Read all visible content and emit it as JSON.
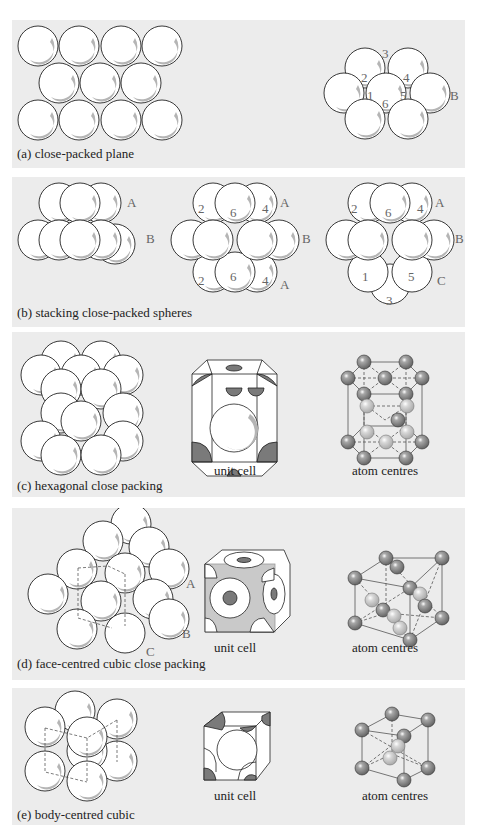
{
  "figure": {
    "panels": [
      {
        "id": "a",
        "caption": "(a) close-packed plane",
        "layer_labels": [
          "B"
        ],
        "site_numbers": [
          "1",
          "2",
          "3",
          "4",
          "5",
          "6"
        ]
      },
      {
        "id": "b",
        "caption": "(b) stacking close-packed spheres",
        "diagrams": [
          {
            "layer_labels": [
              "A",
              "B"
            ]
          },
          {
            "layer_labels": [
              "A",
              "B",
              "A"
            ],
            "site_numbers": [
              "2",
              "6",
              "4",
              "2",
              "6",
              "4"
            ]
          },
          {
            "layer_labels": [
              "A",
              "B",
              "C"
            ],
            "site_numbers": [
              "2",
              "6",
              "4",
              "1",
              "5",
              "3"
            ]
          }
        ]
      },
      {
        "id": "c",
        "caption": "(c) hexagonal close packing",
        "unit_cell_label": "unit cell",
        "atom_centres_label": "atom centres"
      },
      {
        "id": "d",
        "caption": "(d) face-centred cubic  close packing",
        "layer_labels": [
          "A",
          "B",
          "C"
        ],
        "unit_cell_label": "unit cell",
        "atom_centres_label": "atom centres"
      },
      {
        "id": "e",
        "caption": "(e) body-centred cubic",
        "unit_cell_label": "unit cell",
        "atom_centres_label": "atom centres"
      }
    ],
    "colors": {
      "panel_background": "#ececec",
      "sphere_fill": "#ffffff",
      "sphere_shadow": "#b5b5b5",
      "atom_dark": "#7a7a7a",
      "atom_light": "#c4c4c4",
      "label_grey": "#666666"
    }
  }
}
